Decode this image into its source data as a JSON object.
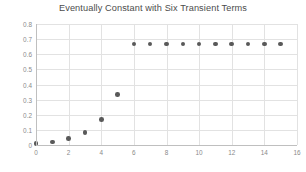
{
  "chart_data": {
    "type": "scatter",
    "title": "Eventually Constant with Six Transient Terms",
    "xlabel": "",
    "ylabel": "",
    "x": [
      0,
      1,
      2,
      3,
      4,
      5,
      6,
      7,
      8,
      9,
      10,
      11,
      12,
      13,
      14,
      15
    ],
    "values": [
      0.01,
      0.021,
      0.042,
      0.083,
      0.167,
      0.333,
      0.667,
      0.667,
      0.667,
      0.667,
      0.667,
      0.667,
      0.667,
      0.667,
      0.667,
      0.667
    ],
    "series": [
      {
        "name": "sequence",
        "values": [
          0.01,
          0.021,
          0.042,
          0.083,
          0.167,
          0.333,
          0.667,
          0.667,
          0.667,
          0.667,
          0.667,
          0.667,
          0.667,
          0.667,
          0.667,
          0.667
        ]
      }
    ],
    "xlim": [
      0,
      16
    ],
    "ylim": [
      0,
      0.8
    ],
    "xticks": [
      0,
      2,
      4,
      6,
      8,
      10,
      12,
      14,
      16
    ],
    "xtick_labels": [
      "0",
      "2",
      "4",
      "6",
      "8",
      "10",
      "12",
      "14",
      "16"
    ],
    "yticks": [
      0,
      0.1,
      0.2,
      0.3,
      0.4,
      0.5,
      0.6,
      0.7,
      0.8
    ],
    "ytick_labels": [
      "0",
      "0.1",
      "0.2",
      "0.3",
      "0.4",
      "0.5",
      "0.6",
      "0.7",
      "0.8"
    ],
    "grid": true,
    "grid_color": "#e2e2e2",
    "legend": false,
    "legend_position": "none",
    "marker_color": "#595959",
    "title_color": "#4c4c4c",
    "tick_label_color": "#8a8a8a",
    "axis_color": "#bfbfbf",
    "background_color": "#ffffff",
    "transient_count": 6,
    "constant_value": 0.667
  }
}
